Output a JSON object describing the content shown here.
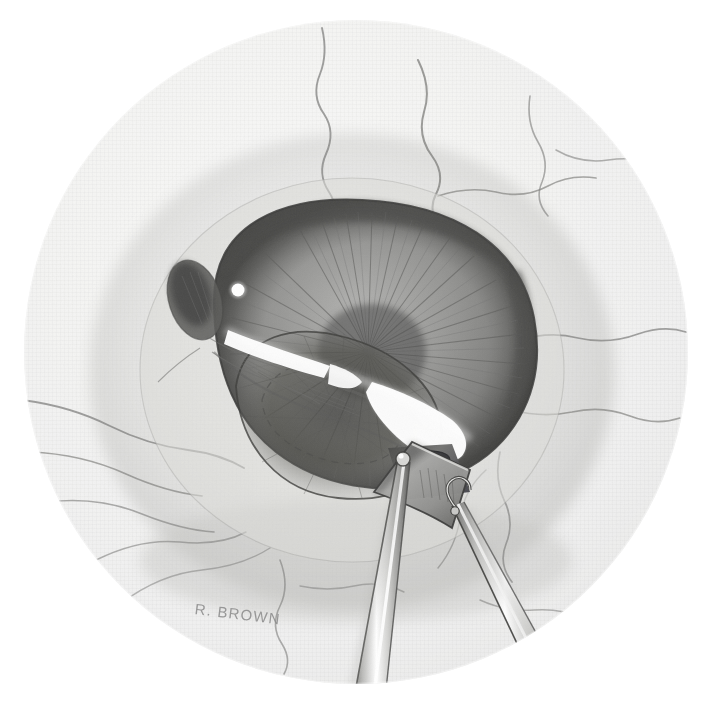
{
  "figure": {
    "domain": "medical-illustration",
    "medium": "graphite pencil drawing on textured paper",
    "palette": {
      "paper": "#ffffff",
      "field_light": "#e9e9e7",
      "field_mid": "#dcdcd9",
      "field_shadow": "#cfcfcc",
      "sclera_light": "#e3e3e0",
      "limbus_dark": "#6f6f6f",
      "cornea_mid": "#9d9d9d",
      "cornea_dark": "#5d5d5d",
      "iris_mid": "#8c8c8c",
      "iris_dark": "#4f4f4f",
      "pupil_dark": "#3a3a3a",
      "vessel": "#7a7a7a",
      "instrument_metal": "#b9b9b6",
      "instrument_highlight": "#ffffff",
      "instrument_edge": "#4a4a4a",
      "specular": "#ffffff",
      "outline": "#3c3c3c",
      "signature": "#8d8d8d"
    },
    "geometry": {
      "canvas_width": 714,
      "canvas_height": 709,
      "field_center_x": 356,
      "field_center_y": 352,
      "field_radius": 332
    }
  },
  "signature": {
    "text": "R. BROWN",
    "artist": "R. Brown",
    "x": 196,
    "y": 600,
    "rotation_deg": 7
  },
  "regions": [
    {
      "id": "surgical-field",
      "label": "Circular surgical field (operating microscope view)",
      "shape": "circle"
    },
    {
      "id": "sclera",
      "label": "Sclera with episcleral vessels",
      "shape": "annulus"
    },
    {
      "id": "cornea",
      "label": "Cornea with limbal arcade",
      "shape": "dome"
    },
    {
      "id": "iris",
      "label": "Iris with radial striations",
      "shape": "crescent"
    },
    {
      "id": "pupil",
      "label": "Pupil margin",
      "shape": "oval"
    },
    {
      "id": "iridectomy",
      "label": "Peripheral iridectomy aperture",
      "shape": "oval"
    },
    {
      "id": "scleral-flap",
      "label": "Triangular scleral flap elevated by forceps",
      "shape": "triangle"
    }
  ],
  "instruments": [
    {
      "id": "forceps-left",
      "label": "Tying forceps (left) grasping flap apex",
      "tip_x": 403,
      "tip_y": 462
    },
    {
      "id": "forceps-right",
      "label": "Tying forceps (right) engaging flap edge",
      "tip_x": 455,
      "tip_y": 511
    }
  ],
  "vessels": {
    "label": "Episcleral and conjunctival vessels",
    "count": 9,
    "color": "#7a7a7a"
  },
  "highlights": [
    {
      "id": "specular-upper",
      "label": "Corneal light reflex (upper)"
    },
    {
      "id": "specular-lower",
      "label": "Corneal light reflex (lower)"
    },
    {
      "id": "specular-dot",
      "label": "Small specular dot near limbus"
    }
  ]
}
